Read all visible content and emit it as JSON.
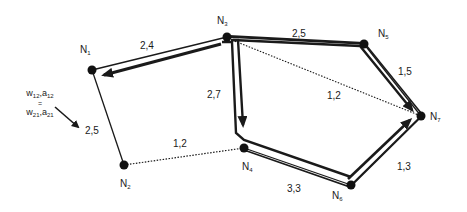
{
  "diagram": {
    "nodes": [
      {
        "id": "N1",
        "base": "N",
        "sub": "1",
        "x": 92,
        "y": 70,
        "label_x": 80,
        "label_y": 47
      },
      {
        "id": "N2",
        "base": "N",
        "sub": "2",
        "x": 124,
        "y": 165,
        "label_x": 120,
        "label_y": 180
      },
      {
        "id": "N3",
        "base": "N",
        "sub": "3",
        "x": 227,
        "y": 37,
        "label_x": 217,
        "label_y": 17
      },
      {
        "id": "N4",
        "base": "N",
        "sub": "4",
        "x": 244,
        "y": 148,
        "label_x": 242,
        "label_y": 162
      },
      {
        "id": "N5",
        "base": "N",
        "sub": "5",
        "x": 364,
        "y": 44,
        "label_x": 378,
        "label_y": 30
      },
      {
        "id": "N6",
        "base": "N",
        "sub": "6",
        "x": 351,
        "y": 185,
        "label_x": 332,
        "label_y": 191
      },
      {
        "id": "N7",
        "base": "N",
        "sub": "7",
        "x": 421,
        "y": 116,
        "label_x": 430,
        "label_y": 113
      }
    ],
    "edges": [
      {
        "from": "N1",
        "to": "N3",
        "weight": "2,4",
        "style": "solid",
        "label_x": 140,
        "label_y": 42
      },
      {
        "from": "N1",
        "to": "N2",
        "weight": "2,5",
        "style": "solid",
        "label_x": 85,
        "label_y": 125
      },
      {
        "from": "N2",
        "to": "N4",
        "weight": "1,2",
        "style": "dotted",
        "label_x": 173,
        "label_y": 140
      },
      {
        "from": "N3",
        "to": "N4",
        "weight": "2,7",
        "style": "solid",
        "label_x": 207,
        "label_y": 91
      },
      {
        "from": "N3",
        "to": "N5",
        "weight": "2,5",
        "style": "solid",
        "label_x": 292,
        "label_y": 30
      },
      {
        "from": "N3",
        "to": "N7",
        "weight": "1,2",
        "style": "dotted",
        "label_x": 327,
        "label_y": 92
      },
      {
        "from": "N5",
        "to": "N7",
        "weight": "1,5",
        "style": "solid",
        "label_x": 398,
        "label_y": 68
      },
      {
        "from": "N4",
        "to": "N6",
        "weight": "3,3",
        "style": "solid",
        "label_x": 287,
        "label_y": 184
      },
      {
        "from": "N6",
        "to": "N7",
        "weight": "1,3",
        "style": "solid",
        "label_x": 397,
        "label_y": 162
      }
    ],
    "paths": [
      {
        "name": "path-n3-to-n1",
        "description": "bold arrow from N3 to N1"
      },
      {
        "name": "path-n3-n4",
        "description": "bold arrow from N3 down to N4"
      },
      {
        "name": "path-n3-n5-n7",
        "description": "bold arrow from N3 via N5 to N7"
      },
      {
        "name": "path-n4-n6-n7",
        "description": "bold arrow from N4 via N6 to N7"
      }
    ],
    "legend": {
      "top_w": "w",
      "top_w_sub": "12",
      "top_sep": ",",
      "top_a": "a",
      "top_a_sub": "12",
      "equals": "=",
      "bottom_w": "w",
      "bottom_w_sub": "21",
      "bottom_sep": ",",
      "bottom_a": "a",
      "bottom_a_sub": "21"
    }
  }
}
